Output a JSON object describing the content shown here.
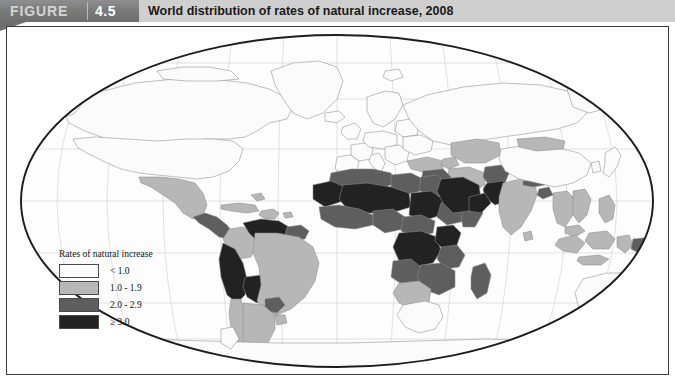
{
  "banner": {
    "figure_label": "FIGURE",
    "figure_number": "4.5",
    "title": "World distribution of rates of natural increase, 2008",
    "bar_color": "#6e6e6e",
    "strip_color": "#cfcfcf"
  },
  "legend": {
    "title": "Rates of natural increase",
    "items": [
      {
        "label": "< 1.0",
        "color": "#fbfbfb"
      },
      {
        "label": "1.0 - 1.9",
        "color": "#b7b7b7"
      },
      {
        "label": "2.0 - 2.9",
        "color": "#5e5e5e"
      },
      {
        "label": "≥ 3.0",
        "color": "#222222"
      }
    ]
  },
  "map": {
    "projection": "robinson-ellipse",
    "ocean_color": "#fdfdfd",
    "graticule_color": "#d7d7d7",
    "outline_color": "#1c1c1c",
    "border_color": "#8c8c8c",
    "classes": {
      "lt1": "#fbfbfb",
      "c1to19": "#b7b7b7",
      "c2to29": "#5e5e5e",
      "ge3": "#222222"
    },
    "regions": [
      {
        "name": "canada",
        "class": "lt1"
      },
      {
        "name": "united-states",
        "class": "lt1"
      },
      {
        "name": "greenland",
        "class": "lt1"
      },
      {
        "name": "mexico",
        "class": "c1to19"
      },
      {
        "name": "central-america",
        "class": "c2to29"
      },
      {
        "name": "caribbean",
        "class": "c1to19"
      },
      {
        "name": "colombia",
        "class": "c1to19"
      },
      {
        "name": "venezuela",
        "class": "c2to29"
      },
      {
        "name": "guyanas",
        "class": "c2to29"
      },
      {
        "name": "brazil",
        "class": "c1to19"
      },
      {
        "name": "peru-bolivia-ecuador",
        "class": "c2to29"
      },
      {
        "name": "chile-argentina-uruguay",
        "class": "c1to19"
      },
      {
        "name": "paraguay",
        "class": "c2to29"
      },
      {
        "name": "western-europe",
        "class": "lt1"
      },
      {
        "name": "eastern-europe",
        "class": "lt1"
      },
      {
        "name": "russia",
        "class": "lt1"
      },
      {
        "name": "scandinavia",
        "class": "lt1"
      },
      {
        "name": "turkey",
        "class": "c1to19"
      },
      {
        "name": "north-africa",
        "class": "c2to29"
      },
      {
        "name": "egypt",
        "class": "c2to29"
      },
      {
        "name": "sahel",
        "class": "ge3"
      },
      {
        "name": "west-africa",
        "class": "c2to29"
      },
      {
        "name": "central-africa",
        "class": "ge3"
      },
      {
        "name": "east-africa",
        "class": "c2to29"
      },
      {
        "name": "ethiopia",
        "class": "c2to29"
      },
      {
        "name": "southern-africa",
        "class": "c2to29"
      },
      {
        "name": "namibia-botswana",
        "class": "c1to19"
      },
      {
        "name": "south-africa",
        "class": "lt1"
      },
      {
        "name": "madagascar",
        "class": "c2to29"
      },
      {
        "name": "arabian-peninsula",
        "class": "ge3"
      },
      {
        "name": "iran",
        "class": "c1to19"
      },
      {
        "name": "iraq-syria",
        "class": "c2to29"
      },
      {
        "name": "afghanistan-pakistan",
        "class": "c2to29"
      },
      {
        "name": "india",
        "class": "c1to19"
      },
      {
        "name": "central-asia",
        "class": "c1to19"
      },
      {
        "name": "china",
        "class": "lt1"
      },
      {
        "name": "mongolia",
        "class": "c1to19"
      },
      {
        "name": "japan-korea",
        "class": "lt1"
      },
      {
        "name": "southeast-asia",
        "class": "c1to19"
      },
      {
        "name": "indonesia",
        "class": "c1to19"
      },
      {
        "name": "philippines",
        "class": "c1to19"
      },
      {
        "name": "papua-new-guinea",
        "class": "c2to29"
      },
      {
        "name": "australia",
        "class": "lt1"
      },
      {
        "name": "new-zealand",
        "class": "lt1"
      },
      {
        "name": "antarctica",
        "class": "lt1"
      }
    ]
  }
}
